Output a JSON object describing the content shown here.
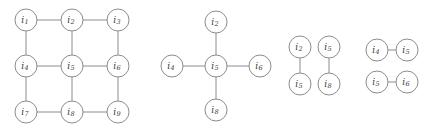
{
  "figure": {
    "background_color": "#ffffff",
    "node_fill": "#ffffff",
    "node_stroke": "#8c8c8c",
    "edge_color": "#8c8c8c",
    "label_color": "#3a3a3a",
    "node_radius": 11,
    "width": 431,
    "height": 132
  },
  "chart_data": {
    "type": "diagram",
    "title": "",
    "subtitle": "",
    "xlabel": "",
    "ylabel": "",
    "panels": [
      {
        "id": "panel-grid",
        "name": "grid-graph",
        "layout": "grid-3x3",
        "nodes": [
          {
            "id": "i1",
            "label": "i",
            "sub": "1",
            "x": 26,
            "y": 20
          },
          {
            "id": "i2",
            "label": "i",
            "sub": "2",
            "x": 72,
            "y": 20
          },
          {
            "id": "i3",
            "label": "i",
            "sub": "3",
            "x": 118,
            "y": 20
          },
          {
            "id": "i4",
            "label": "i",
            "sub": "4",
            "x": 26,
            "y": 66
          },
          {
            "id": "i5",
            "label": "i",
            "sub": "5",
            "x": 72,
            "y": 66
          },
          {
            "id": "i6",
            "label": "i",
            "sub": "6",
            "x": 118,
            "y": 66
          },
          {
            "id": "i7",
            "label": "i",
            "sub": "7",
            "x": 26,
            "y": 112
          },
          {
            "id": "i8",
            "label": "i",
            "sub": "8",
            "x": 72,
            "y": 112
          },
          {
            "id": "i9",
            "label": "i",
            "sub": "9",
            "x": 118,
            "y": 112
          }
        ],
        "edges": [
          {
            "source": "i1",
            "target": "i2"
          },
          {
            "source": "i2",
            "target": "i3"
          },
          {
            "source": "i4",
            "target": "i5"
          },
          {
            "source": "i5",
            "target": "i6"
          },
          {
            "source": "i7",
            "target": "i8"
          },
          {
            "source": "i8",
            "target": "i9"
          },
          {
            "source": "i1",
            "target": "i4"
          },
          {
            "source": "i4",
            "target": "i7"
          },
          {
            "source": "i2",
            "target": "i5"
          },
          {
            "source": "i5",
            "target": "i8"
          },
          {
            "source": "i3",
            "target": "i6"
          },
          {
            "source": "i6",
            "target": "i9"
          }
        ]
      },
      {
        "id": "panel-star",
        "name": "star-graph",
        "layout": "star-plus",
        "nodes": [
          {
            "id": "s-i2",
            "label": "i",
            "sub": "2",
            "x": 216,
            "y": 22
          },
          {
            "id": "s-i4",
            "label": "i",
            "sub": "4",
            "x": 172,
            "y": 66
          },
          {
            "id": "s-i5",
            "label": "i",
            "sub": "5",
            "x": 216,
            "y": 66
          },
          {
            "id": "s-i6",
            "label": "i",
            "sub": "6",
            "x": 260,
            "y": 66
          },
          {
            "id": "s-i8",
            "label": "i",
            "sub": "8",
            "x": 216,
            "y": 110
          }
        ],
        "edges": [
          {
            "source": "s-i5",
            "target": "s-i2"
          },
          {
            "source": "s-i5",
            "target": "s-i4"
          },
          {
            "source": "s-i5",
            "target": "s-i6"
          },
          {
            "source": "s-i5",
            "target": "s-i8"
          }
        ]
      },
      {
        "id": "panel-vertical-pairs",
        "name": "vertical-edge-pairs",
        "layout": "two-vertical-edges",
        "nodes": [
          {
            "id": "v-i2",
            "label": "i",
            "sub": "2",
            "x": 300,
            "y": 47
          },
          {
            "id": "v-i5a",
            "label": "i",
            "sub": "5",
            "x": 300,
            "y": 84
          },
          {
            "id": "v-i5b",
            "label": "i",
            "sub": "5",
            "x": 329,
            "y": 47
          },
          {
            "id": "v-i8",
            "label": "i",
            "sub": "8",
            "x": 329,
            "y": 84
          }
        ],
        "edges": [
          {
            "source": "v-i2",
            "target": "v-i5a"
          },
          {
            "source": "v-i5b",
            "target": "v-i8"
          }
        ]
      },
      {
        "id": "panel-horizontal-pairs",
        "name": "horizontal-edge-pairs",
        "layout": "two-horizontal-edges",
        "nodes": [
          {
            "id": "h-i4",
            "label": "i",
            "sub": "4",
            "x": 377,
            "y": 50
          },
          {
            "id": "h-i5a",
            "label": "i",
            "sub": "5",
            "x": 407,
            "y": 50
          },
          {
            "id": "h-i5b",
            "label": "i",
            "sub": "5",
            "x": 377,
            "y": 82
          },
          {
            "id": "h-i6",
            "label": "i",
            "sub": "6",
            "x": 407,
            "y": 82
          }
        ],
        "edges": [
          {
            "source": "h-i4",
            "target": "h-i5a"
          },
          {
            "source": "h-i5b",
            "target": "h-i6"
          }
        ]
      }
    ]
  }
}
